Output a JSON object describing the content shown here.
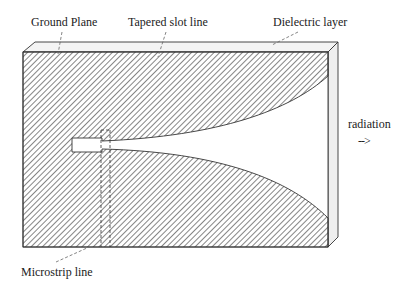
{
  "labels": {
    "ground_plane": "Ground Plane",
    "tapered_slot_line": "Tapered slot line",
    "dielectric_layer": "Dielectric layer",
    "radiation": "radiation",
    "radiation_arrow": "-->",
    "microstrip_line": "Microstrip line"
  },
  "colors": {
    "stroke": "#333333",
    "hatch": "#444444",
    "dielectric_fill": "#f4f4f4",
    "background": "#ffffff"
  }
}
